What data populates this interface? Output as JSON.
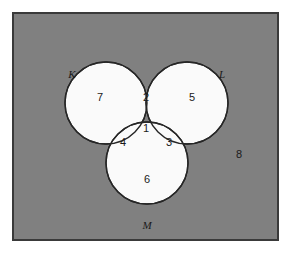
{
  "figure": {
    "type": "venn-diagram-3-set",
    "caption": "",
    "background_color": "#ffffff",
    "universe_fill": "#808080",
    "universe_stroke": "#3a3a3a",
    "circle_fill": "#fafafa",
    "circle_stroke": "#262626"
  },
  "sets": [
    {
      "id": "K",
      "label": "K",
      "label_x": 72,
      "label_y": 75,
      "cx": 106,
      "cy": 103,
      "r": 41
    },
    {
      "id": "L",
      "label": "L",
      "label_x": 222,
      "label_y": 75,
      "cx": 187,
      "cy": 103,
      "r": 41
    },
    {
      "id": "M",
      "label": "M",
      "label_x": 147,
      "label_y": 226,
      "cx": 147,
      "cy": 163,
      "r": 41
    }
  ],
  "regions": [
    {
      "id": "K-only",
      "count": "7",
      "x": 100,
      "y": 98,
      "description": "K only"
    },
    {
      "id": "K-and-L",
      "count": "2",
      "x": 146,
      "y": 98,
      "description": "K and L only"
    },
    {
      "id": "L-only",
      "count": "5",
      "x": 192,
      "y": 98,
      "description": "L only"
    },
    {
      "id": "K-and-M",
      "count": "4",
      "x": 123,
      "y": 143,
      "description": "K and M only"
    },
    {
      "id": "K-L-M",
      "count": "1",
      "x": 146,
      "y": 129,
      "description": "K and L and M"
    },
    {
      "id": "L-and-M",
      "count": "3",
      "x": 169,
      "y": 143,
      "description": "L and M only"
    },
    {
      "id": "M-only",
      "count": "6",
      "x": 147,
      "y": 180,
      "description": "M only"
    },
    {
      "id": "outside",
      "count": "8",
      "x": 239,
      "y": 155,
      "description": "outside all sets"
    }
  ],
  "universe": {
    "x": 13,
    "y": 13,
    "width": 265,
    "height": 227
  }
}
